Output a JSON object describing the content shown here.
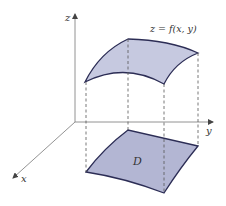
{
  "figure": {
    "axes": {
      "z_label": "z",
      "y_label": "y",
      "x_label": "x"
    },
    "surface_label": "z = f(x, y)",
    "region_label": "D"
  },
  "colors": {
    "fill": "#c6c9e0",
    "fill_region": "#b3b6d3",
    "stroke": "#2c2d55",
    "axis": "#666666",
    "dash": "#555555"
  }
}
